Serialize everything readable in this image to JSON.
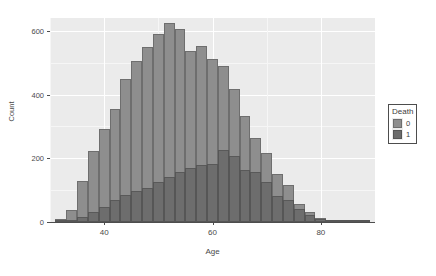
{
  "chart_data": {
    "type": "bar",
    "subtype": "histogram-overlay",
    "title": "",
    "xlabel": "Age",
    "ylabel": "Count",
    "xlim": [
      30,
      90
    ],
    "ylim": [
      0,
      640
    ],
    "bin_width": 2,
    "grid": true,
    "legend": {
      "title": "Death",
      "position": "right",
      "entries": [
        {
          "label": "0",
          "color": "#8e8e8e"
        },
        {
          "label": "1",
          "color": "#6b6b6b"
        }
      ]
    },
    "x_ticks": [
      {
        "value": 40,
        "label": "40"
      },
      {
        "value": 60,
        "label": "60"
      },
      {
        "value": 80,
        "label": "80"
      }
    ],
    "x_minor_ticks": [
      30,
      50,
      70,
      90
    ],
    "y_ticks": [
      {
        "value": 0,
        "label": "0"
      },
      {
        "value": 200,
        "label": "200"
      },
      {
        "value": 400,
        "label": "400"
      },
      {
        "value": 600,
        "label": "600"
      }
    ],
    "y_minor_ticks": [
      100,
      300,
      500
    ],
    "bin_centers": [
      32,
      34,
      36,
      38,
      40,
      42,
      44,
      46,
      48,
      50,
      52,
      54,
      56,
      58,
      60,
      62,
      64,
      66,
      68,
      70,
      72,
      74,
      76,
      78,
      80,
      82,
      84,
      86,
      88
    ],
    "series": [
      {
        "name": "0",
        "color": "#8e8e8e",
        "values": [
          8,
          38,
          130,
          222,
          292,
          355,
          448,
          505,
          548,
          590,
          625,
          605,
          538,
          553,
          510,
          490,
          418,
          332,
          265,
          218,
          152,
          116,
          58,
          30,
          12,
          6,
          3,
          2,
          1
        ]
      },
      {
        "name": "1",
        "color": "#6b6b6b",
        "values": [
          2,
          6,
          16,
          31,
          47,
          68,
          86,
          98,
          108,
          126,
          140,
          158,
          170,
          180,
          182,
          225,
          208,
          163,
          158,
          126,
          82,
          70,
          40,
          22,
          10,
          5,
          2,
          1,
          1
        ]
      }
    ]
  }
}
